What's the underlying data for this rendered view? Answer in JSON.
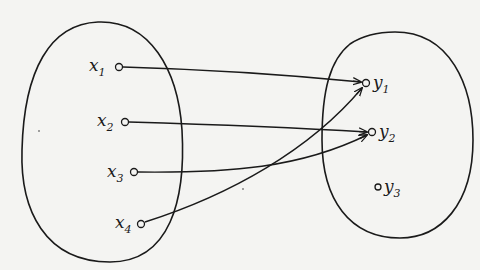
{
  "diagram": {
    "type": "mapping",
    "colors": {
      "background": "#f4f4f2",
      "ink": "#1a1a1a"
    },
    "sets": [
      {
        "id": "X",
        "elements": [
          "x1",
          "x2",
          "x3",
          "x4"
        ]
      },
      {
        "id": "Y",
        "elements": [
          "y1",
          "y2",
          "y3"
        ]
      }
    ],
    "labels": {
      "x1": {
        "base": "x",
        "sub": "1"
      },
      "x2": {
        "base": "x",
        "sub": "2"
      },
      "x3": {
        "base": "x",
        "sub": "3"
      },
      "x4": {
        "base": "x",
        "sub": "4"
      },
      "y1": {
        "base": "y",
        "sub": "1"
      },
      "y2": {
        "base": "y",
        "sub": "2"
      },
      "y3": {
        "base": "y",
        "sub": "3"
      }
    },
    "arrows": [
      {
        "from": "x1",
        "to": "y1"
      },
      {
        "from": "x2",
        "to": "y2"
      },
      {
        "from": "x3",
        "to": "y2"
      },
      {
        "from": "x4",
        "to": "y1"
      }
    ]
  }
}
